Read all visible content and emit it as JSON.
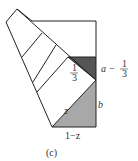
{
  "figure": {
    "caption": "(c)",
    "labels": {
      "a_minus": "a −",
      "frac_num": "1",
      "frac_den": "3",
      "inner_num": "1",
      "inner_den": "3",
      "z": "z",
      "b": "b",
      "one_minus_z": "1−z"
    },
    "colors": {
      "dark_fill": "#555555",
      "light_fill": "#a8a8a8",
      "stroke": "#222222"
    }
  }
}
